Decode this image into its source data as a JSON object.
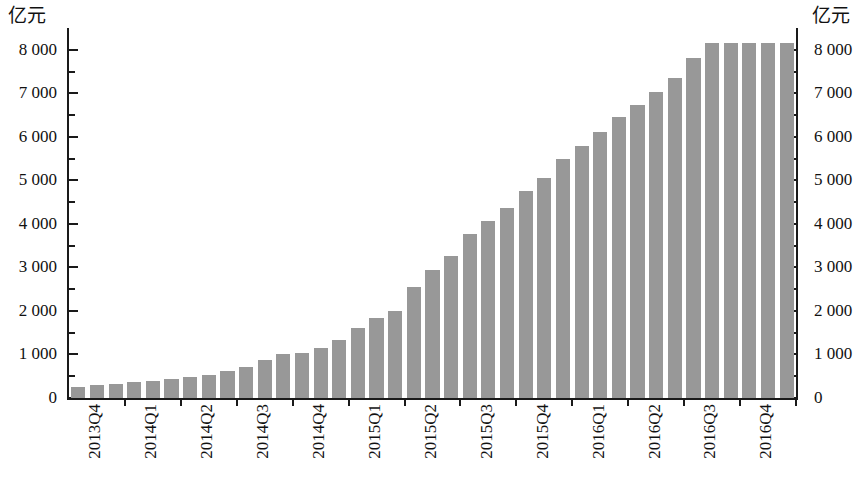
{
  "axes": {
    "left_unit_label": "亿元",
    "right_unit_label": "亿元",
    "y_tick_labels": [
      "8 000",
      "7 000",
      "6 000",
      "5 000",
      "4 000",
      "3 000",
      "2 000",
      "1 000",
      "0"
    ],
    "x_tick_labels": [
      "2013Q4",
      "2014Q1",
      "2014Q2",
      "2014Q3",
      "2014Q4",
      "2015Q1",
      "2015Q2",
      "2015Q3",
      "2015Q4",
      "2016Q1",
      "2016Q2",
      "2016Q3",
      "2016Q4"
    ]
  },
  "style": {
    "bar_color": "#989898",
    "axis_color": "#1a1a1a",
    "background": "#ffffff"
  },
  "chart_data": {
    "type": "bar",
    "title": "",
    "subtitle": "",
    "xlabel": "",
    "ylabel": "亿元",
    "y2label": "亿元",
    "ylim": [
      0,
      8500
    ],
    "y_ticks_major": [
      0,
      1000,
      2000,
      3000,
      4000,
      5000,
      6000,
      7000,
      8000
    ],
    "y_ticks_minor": [
      500,
      1500,
      2500,
      3500,
      4500,
      5500,
      6500,
      7500
    ],
    "grid": false,
    "legend": "none",
    "x_group_labels": [
      "2013Q4",
      "2014Q1",
      "2014Q2",
      "2014Q3",
      "2014Q4",
      "2015Q1",
      "2015Q2",
      "2015Q3",
      "2015Q4",
      "2016Q1",
      "2016Q2",
      "2016Q3",
      "2016Q4"
    ],
    "bars_per_group": 3,
    "categories": [
      "2013Q4-M1",
      "2013Q4-M2",
      "2013Q4-M3",
      "2014Q1-M1",
      "2014Q1-M2",
      "2014Q1-M3",
      "2014Q2-M1",
      "2014Q2-M2",
      "2014Q2-M3",
      "2014Q3-M1",
      "2014Q3-M2",
      "2014Q3-M3",
      "2014Q4-M1",
      "2014Q4-M2",
      "2014Q4-M3",
      "2015Q1-M1",
      "2015Q1-M2",
      "2015Q1-M3",
      "2015Q2-M1",
      "2015Q2-M2",
      "2015Q2-M3",
      "2015Q3-M1",
      "2015Q3-M2",
      "2015Q3-M3",
      "2015Q4-M1",
      "2015Q4-M2",
      "2015Q4-M3",
      "2016Q1-M1",
      "2016Q1-M2",
      "2016Q1-M3",
      "2016Q2-M1",
      "2016Q2-M2",
      "2016Q2-M3",
      "2016Q3-M1",
      "2016Q3-M2",
      "2016Q3-M3",
      "2016Q4-M1",
      "2016Q4-M2",
      "2016Q4-M3"
    ],
    "values": [
      250,
      290,
      330,
      360,
      400,
      440,
      480,
      540,
      610,
      720,
      880,
      1020,
      1040,
      1140,
      1330,
      1600,
      1840,
      1990,
      2540,
      2940,
      3270,
      3760,
      4060,
      4370,
      4760,
      5050,
      5490,
      5780,
      6100,
      6460,
      6720,
      7030,
      7350,
      7800,
      8150,
      8150,
      8150,
      8150,
      8150
    ]
  }
}
